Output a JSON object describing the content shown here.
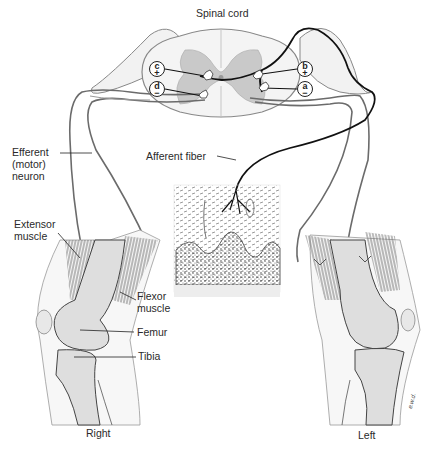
{
  "diagram": {
    "title": "Spinal cord",
    "labels": {
      "efferent": "Efferent\n(motor)\nneuron",
      "afferent": "Afferent fiber",
      "extensor": "Extensor\nmuscle",
      "flexor": "Flexor\nmuscle",
      "femur": "Femur",
      "tibia": "Tibia",
      "right": "Right",
      "left": "Left"
    },
    "interneurons": [
      {
        "id": "a",
        "sign": "−"
      },
      {
        "id": "b",
        "sign": "+"
      },
      {
        "id": "c",
        "sign": "+"
      },
      {
        "id": "d",
        "sign": "−"
      }
    ],
    "signature": "e.w.d.",
    "colors": {
      "afferent_line": "#111111",
      "efferent_line": "#555555",
      "bone_fill": "#dcdcdc",
      "muscle": "#7a7a7a",
      "cord_fill": "#ececec",
      "gray_matter": "#c8c8c8"
    }
  }
}
